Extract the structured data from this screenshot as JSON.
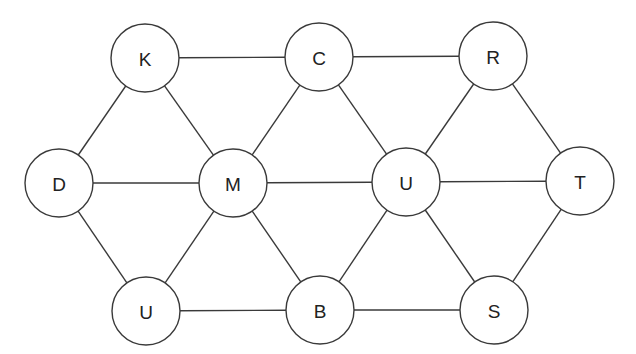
{
  "diagram": {
    "type": "undirected-graph",
    "node_radius": 34,
    "colors": {
      "stroke": "#3a3a3a",
      "fill": "#ffffff",
      "text": "#222222",
      "background": "#ffffff"
    },
    "nodes": [
      {
        "id": "K",
        "label": "K",
        "x": 145,
        "y": 58
      },
      {
        "id": "C",
        "label": "C",
        "x": 319,
        "y": 57
      },
      {
        "id": "R",
        "label": "R",
        "x": 493,
        "y": 56
      },
      {
        "id": "D",
        "label": "D",
        "x": 59,
        "y": 183
      },
      {
        "id": "M",
        "label": "M",
        "x": 233,
        "y": 183
      },
      {
        "id": "U",
        "label": "U",
        "x": 406,
        "y": 182
      },
      {
        "id": "T",
        "label": "T",
        "x": 580,
        "y": 181
      },
      {
        "id": "U2",
        "label": "U",
        "x": 146,
        "y": 311
      },
      {
        "id": "B",
        "label": "B",
        "x": 320,
        "y": 310
      },
      {
        "id": "S",
        "label": "S",
        "x": 494,
        "y": 310
      }
    ],
    "edges": [
      [
        "K",
        "C"
      ],
      [
        "C",
        "R"
      ],
      [
        "K",
        "D"
      ],
      [
        "K",
        "M"
      ],
      [
        "C",
        "M"
      ],
      [
        "C",
        "U"
      ],
      [
        "R",
        "U"
      ],
      [
        "R",
        "T"
      ],
      [
        "D",
        "M"
      ],
      [
        "M",
        "U"
      ],
      [
        "U",
        "T"
      ],
      [
        "D",
        "U2"
      ],
      [
        "M",
        "U2"
      ],
      [
        "M",
        "B"
      ],
      [
        "U",
        "B"
      ],
      [
        "U",
        "S"
      ],
      [
        "T",
        "S"
      ],
      [
        "U2",
        "B"
      ],
      [
        "B",
        "S"
      ]
    ]
  }
}
